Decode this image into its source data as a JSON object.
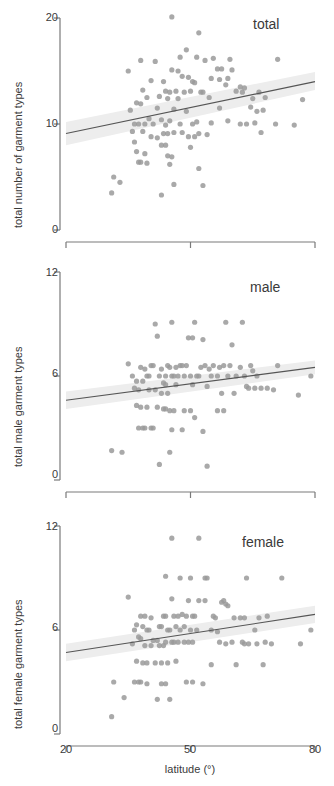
{
  "figure": {
    "type": "scatter-multi-panel",
    "panel_count": 3,
    "point_color": "#9a9a9a",
    "line_color": "#555555",
    "band_color": "#ededed",
    "axis_color": "#7a7a7a",
    "background": "#ffffff"
  },
  "xaxis": {
    "label": "latitude (°)",
    "ticks": [
      "20",
      "50",
      "80"
    ],
    "tick_values": [
      20,
      50,
      80
    ],
    "range": [
      20,
      80
    ]
  },
  "panels": [
    {
      "tag": "total",
      "ylabel": "total number of garment types",
      "yticks": [
        "0",
        "10",
        "20"
      ],
      "ytick_values": [
        0,
        10,
        20
      ],
      "yrange": [
        0,
        20
      ]
    },
    {
      "tag": "male",
      "ylabel": "total male garment types",
      "yticks": [
        "0",
        "6",
        "12"
      ],
      "ytick_values": [
        0,
        6,
        12
      ],
      "yrange": [
        0,
        12
      ]
    },
    {
      "tag": "female",
      "ylabel": "total female garment types",
      "yticks": [
        "0",
        "6",
        "12"
      ],
      "ytick_values": [
        0,
        6,
        12
      ],
      "yrange": [
        0,
        12
      ]
    }
  ],
  "chart_data": [
    {
      "type": "scatter",
      "title": "total",
      "xlabel": "latitude (°)",
      "ylabel": "total number of garment types",
      "xlim": [
        20,
        80
      ],
      "ylim": [
        0,
        20
      ],
      "xticks": [
        20,
        50,
        80
      ],
      "yticks": [
        0,
        10,
        20
      ],
      "grid": false,
      "legend": "none",
      "annotations": [
        "total"
      ],
      "regression": {
        "x": [
          20,
          80
        ],
        "y": [
          9.1,
          14.0
        ],
        "ci_lower": [
          8.0,
          13.2
        ],
        "ci_upper": [
          10.2,
          14.9
        ]
      },
      "points": [
        [
          45.5,
          20.1
        ],
        [
          52.0,
          18.6
        ],
        [
          49.0,
          17.0
        ],
        [
          47.5,
          16.3
        ],
        [
          51.5,
          16.3
        ],
        [
          55.5,
          16.2
        ],
        [
          53.5,
          16.0
        ],
        [
          59.5,
          16.1
        ],
        [
          71.0,
          16.1
        ],
        [
          38.0,
          16.0
        ],
        [
          41.5,
          15.9
        ],
        [
          35.0,
          15.0
        ],
        [
          45.5,
          15.1
        ],
        [
          47.0,
          15.0
        ],
        [
          56.5,
          15.2
        ],
        [
          57.5,
          15.2
        ],
        [
          60.0,
          15.1
        ],
        [
          48.0,
          14.5
        ],
        [
          49.5,
          14.4
        ],
        [
          55.0,
          14.3
        ],
        [
          59.0,
          14.3
        ],
        [
          57.0,
          14.2
        ],
        [
          40.5,
          14.1
        ],
        [
          43.5,
          14.0
        ],
        [
          50.5,
          14.0
        ],
        [
          51.0,
          13.9
        ],
        [
          58.5,
          13.7
        ],
        [
          62.0,
          13.5
        ],
        [
          63.0,
          13.4
        ],
        [
          38.5,
          13.2
        ],
        [
          44.0,
          13.1
        ],
        [
          45.0,
          13.0
        ],
        [
          46.5,
          13.1
        ],
        [
          48.5,
          13.0
        ],
        [
          50.0,
          13.1
        ],
        [
          52.5,
          13.0
        ],
        [
          53.0,
          13.0
        ],
        [
          61.0,
          13.1
        ],
        [
          62.5,
          13.0
        ],
        [
          66.5,
          13.0
        ],
        [
          39.5,
          12.5
        ],
        [
          42.5,
          12.6
        ],
        [
          44.5,
          12.4
        ],
        [
          47.0,
          12.4
        ],
        [
          54.5,
          12.5
        ],
        [
          65.0,
          12.4
        ],
        [
          68.0,
          12.5
        ],
        [
          77.0,
          12.3
        ],
        [
          37.0,
          12.0
        ],
        [
          38.0,
          11.9
        ],
        [
          42.0,
          11.5
        ],
        [
          46.0,
          11.4
        ],
        [
          49.0,
          11.2
        ],
        [
          57.0,
          11.5
        ],
        [
          64.5,
          11.6
        ],
        [
          66.0,
          11.2
        ],
        [
          67.5,
          11.3
        ],
        [
          35.5,
          11.3
        ],
        [
          40.0,
          10.5
        ],
        [
          43.0,
          10.4
        ],
        [
          45.0,
          10.3
        ],
        [
          51.5,
          10.2
        ],
        [
          55.0,
          10.1
        ],
        [
          59.0,
          10.3
        ],
        [
          36.5,
          10.0
        ],
        [
          37.5,
          10.0
        ],
        [
          39.0,
          10.0
        ],
        [
          41.0,
          10.0
        ],
        [
          44.0,
          9.9
        ],
        [
          47.5,
          10.0
        ],
        [
          50.5,
          10.0
        ],
        [
          62.0,
          10.0
        ],
        [
          63.5,
          10.0
        ],
        [
          65.5,
          10.1
        ],
        [
          70.5,
          10.0
        ],
        [
          75.0,
          9.9
        ],
        [
          36.0,
          9.3
        ],
        [
          38.5,
          9.3
        ],
        [
          43.5,
          9.1
        ],
        [
          44.5,
          9.1
        ],
        [
          46.0,
          9.2
        ],
        [
          48.0,
          9.2
        ],
        [
          52.0,
          9.1
        ],
        [
          54.0,
          9.0
        ],
        [
          67.0,
          9.2
        ],
        [
          40.5,
          8.8
        ],
        [
          42.0,
          8.7
        ],
        [
          49.5,
          8.8
        ],
        [
          51.0,
          8.8
        ],
        [
          36.5,
          8.3
        ],
        [
          43.0,
          8.0
        ],
        [
          44.0,
          8.0
        ],
        [
          50.0,
          7.8
        ],
        [
          37.0,
          7.4
        ],
        [
          39.0,
          7.2
        ],
        [
          44.5,
          7.0
        ],
        [
          45.5,
          6.9
        ],
        [
          37.5,
          6.4
        ],
        [
          38.0,
          6.4
        ],
        [
          39.5,
          6.3
        ],
        [
          45.0,
          6.2
        ],
        [
          52.0,
          5.8
        ],
        [
          31.5,
          5.0
        ],
        [
          33.0,
          4.5
        ],
        [
          46.0,
          4.3
        ],
        [
          53.0,
          4.2
        ],
        [
          31.0,
          3.5
        ],
        [
          43.0,
          3.3
        ]
      ]
    },
    {
      "type": "scatter",
      "title": "male",
      "xlabel": "latitude (°)",
      "ylabel": "total male garment types",
      "xlim": [
        20,
        80
      ],
      "ylim": [
        0,
        12
      ],
      "xticks": [
        20,
        50,
        80
      ],
      "yticks": [
        0,
        6,
        12
      ],
      "grid": false,
      "legend": "none",
      "annotations": [
        "male"
      ],
      "regression": {
        "x": [
          20,
          80
        ],
        "y": [
          4.6,
          6.5
        ],
        "ci_lower": [
          4.1,
          6.1
        ],
        "ci_upper": [
          5.1,
          6.9
        ]
      },
      "points": [
        [
          45.5,
          9.1
        ],
        [
          51.0,
          9.1
        ],
        [
          58.5,
          9.1
        ],
        [
          62.5,
          9.1
        ],
        [
          41.5,
          9.0
        ],
        [
          42.0,
          8.3
        ],
        [
          49.5,
          8.2
        ],
        [
          50.5,
          8.2
        ],
        [
          53.0,
          8.1
        ],
        [
          60.0,
          7.8
        ],
        [
          35.0,
          6.7
        ],
        [
          40.5,
          6.6
        ],
        [
          41.0,
          6.6
        ],
        [
          44.5,
          6.6
        ],
        [
          45.0,
          6.5
        ],
        [
          47.5,
          6.6
        ],
        [
          48.0,
          6.6
        ],
        [
          49.0,
          6.6
        ],
        [
          52.5,
          6.5
        ],
        [
          53.5,
          6.6
        ],
        [
          55.5,
          6.6
        ],
        [
          57.0,
          6.5
        ],
        [
          58.0,
          6.6
        ],
        [
          59.5,
          6.6
        ],
        [
          62.0,
          6.5
        ],
        [
          64.5,
          6.6
        ],
        [
          71.0,
          6.6
        ],
        [
          38.0,
          6.5
        ],
        [
          39.0,
          6.4
        ],
        [
          43.0,
          6.4
        ],
        [
          46.5,
          6.5
        ],
        [
          54.5,
          6.4
        ],
        [
          65.0,
          6.3
        ],
        [
          36.0,
          6.0
        ],
        [
          39.5,
          6.0
        ],
        [
          40.0,
          6.0
        ],
        [
          42.5,
          6.0
        ],
        [
          44.0,
          6.0
        ],
        [
          45.5,
          6.0
        ],
        [
          46.0,
          6.0
        ],
        [
          47.0,
          6.0
        ],
        [
          48.5,
          6.0
        ],
        [
          50.0,
          6.0
        ],
        [
          51.5,
          6.0
        ],
        [
          52.0,
          6.0
        ],
        [
          55.0,
          6.0
        ],
        [
          56.5,
          6.0
        ],
        [
          59.0,
          6.0
        ],
        [
          61.0,
          6.0
        ],
        [
          63.0,
          6.0
        ],
        [
          66.0,
          6.0
        ],
        [
          79.0,
          6.0
        ],
        [
          37.0,
          5.7
        ],
        [
          38.5,
          5.7
        ],
        [
          43.5,
          5.6
        ],
        [
          44.0,
          5.5
        ],
        [
          46.5,
          5.5
        ],
        [
          50.5,
          5.5
        ],
        [
          54.0,
          5.4
        ],
        [
          63.5,
          5.4
        ],
        [
          64.0,
          5.3
        ],
        [
          65.5,
          5.3
        ],
        [
          67.0,
          5.3
        ],
        [
          68.5,
          5.3
        ],
        [
          70.0,
          5.2
        ],
        [
          36.5,
          5.3
        ],
        [
          37.5,
          5.2
        ],
        [
          40.0,
          5.2
        ],
        [
          41.5,
          5.2
        ],
        [
          43.0,
          5.0
        ],
        [
          44.5,
          5.0
        ],
        [
          57.5,
          5.0
        ],
        [
          60.5,
          5.0
        ],
        [
          76.0,
          4.9
        ],
        [
          37.0,
          4.3
        ],
        [
          38.0,
          4.2
        ],
        [
          39.5,
          4.2
        ],
        [
          42.0,
          4.2
        ],
        [
          43.5,
          4.1
        ],
        [
          44.0,
          4.1
        ],
        [
          45.0,
          4.0
        ],
        [
          46.0,
          4.0
        ],
        [
          48.5,
          4.0
        ],
        [
          50.0,
          4.0
        ],
        [
          56.5,
          4.0
        ],
        [
          58.0,
          4.0
        ],
        [
          51.0,
          3.6
        ],
        [
          37.5,
          3.0
        ],
        [
          38.5,
          3.0
        ],
        [
          39.0,
          3.0
        ],
        [
          40.5,
          3.0
        ],
        [
          41.0,
          3.0
        ],
        [
          45.5,
          2.9
        ],
        [
          48.0,
          2.9
        ],
        [
          53.0,
          2.8
        ],
        [
          31.0,
          1.7
        ],
        [
          33.5,
          1.6
        ],
        [
          45.0,
          1.6
        ],
        [
          42.5,
          0.9
        ],
        [
          54.0,
          0.8
        ]
      ]
    },
    {
      "type": "scatter",
      "title": "female",
      "xlabel": "latitude (°)",
      "ylabel": "total female garment types",
      "xlim": [
        20,
        80
      ],
      "ylim": [
        0,
        12
      ],
      "xticks": [
        20,
        50,
        80
      ],
      "yticks": [
        0,
        6,
        12
      ],
      "grid": false,
      "legend": "none",
      "annotations": [
        "female"
      ],
      "regression": {
        "x": [
          20,
          80
        ],
        "y": [
          4.7,
          6.9
        ],
        "ci_lower": [
          4.2,
          6.4
        ],
        "ci_upper": [
          5.2,
          7.4
        ]
      },
      "points": [
        [
          45.5,
          11.3
        ],
        [
          52.0,
          11.3
        ],
        [
          44.0,
          9.1
        ],
        [
          47.5,
          9.0
        ],
        [
          50.0,
          9.0
        ],
        [
          53.5,
          9.0
        ],
        [
          54.0,
          9.0
        ],
        [
          63.5,
          9.0
        ],
        [
          72.0,
          9.0
        ],
        [
          35.0,
          7.9
        ],
        [
          45.5,
          7.8
        ],
        [
          49.5,
          7.7
        ],
        [
          52.0,
          7.7
        ],
        [
          53.5,
          7.7
        ],
        [
          57.5,
          7.6
        ],
        [
          58.0,
          7.7
        ],
        [
          58.5,
          7.5
        ],
        [
          59.0,
          7.4
        ],
        [
          38.0,
          6.8
        ],
        [
          39.0,
          6.8
        ],
        [
          40.5,
          6.7
        ],
        [
          43.5,
          6.8
        ],
        [
          44.0,
          6.8
        ],
        [
          46.0,
          6.8
        ],
        [
          47.0,
          6.8
        ],
        [
          48.0,
          6.9
        ],
        [
          49.0,
          6.8
        ],
        [
          50.5,
          6.8
        ],
        [
          51.0,
          6.8
        ],
        [
          55.5,
          6.8
        ],
        [
          56.0,
          6.7
        ],
        [
          60.5,
          6.7
        ],
        [
          62.0,
          6.7
        ],
        [
          63.0,
          6.7
        ],
        [
          66.5,
          6.7
        ],
        [
          68.5,
          6.8
        ],
        [
          37.0,
          6.3
        ],
        [
          38.5,
          6.2
        ],
        [
          42.5,
          6.2
        ],
        [
          43.0,
          6.2
        ],
        [
          46.5,
          6.2
        ],
        [
          48.5,
          6.2
        ],
        [
          36.5,
          6.0
        ],
        [
          39.5,
          6.0
        ],
        [
          40.0,
          6.0
        ],
        [
          44.5,
          6.0
        ],
        [
          45.0,
          6.0
        ],
        [
          47.5,
          6.0
        ],
        [
          50.0,
          6.0
        ],
        [
          51.5,
          6.0
        ],
        [
          55.0,
          6.0
        ],
        [
          56.5,
          5.9
        ],
        [
          65.5,
          6.0
        ],
        [
          79.0,
          6.0
        ],
        [
          37.5,
          5.6
        ],
        [
          38.0,
          5.5
        ],
        [
          41.0,
          5.4
        ],
        [
          42.0,
          5.4
        ],
        [
          44.0,
          5.3
        ],
        [
          45.5,
          5.3
        ],
        [
          46.0,
          5.3
        ],
        [
          47.0,
          5.3
        ],
        [
          48.5,
          5.3
        ],
        [
          49.5,
          5.3
        ],
        [
          50.5,
          5.3
        ],
        [
          57.0,
          5.3
        ],
        [
          58.5,
          5.2
        ],
        [
          60.0,
          5.3
        ],
        [
          62.5,
          5.3
        ],
        [
          63.0,
          5.2
        ],
        [
          64.0,
          5.2
        ],
        [
          66.0,
          5.2
        ],
        [
          68.0,
          5.3
        ],
        [
          69.5,
          5.2
        ],
        [
          76.5,
          5.2
        ],
        [
          36.0,
          5.2
        ],
        [
          39.0,
          5.1
        ],
        [
          40.5,
          5.1
        ],
        [
          42.5,
          5.1
        ],
        [
          43.5,
          5.1
        ],
        [
          37.0,
          4.2
        ],
        [
          38.5,
          4.1
        ],
        [
          39.5,
          4.1
        ],
        [
          41.5,
          4.1
        ],
        [
          43.0,
          4.1
        ],
        [
          44.5,
          4.1
        ],
        [
          46.5,
          4.2
        ],
        [
          55.0,
          4.0
        ],
        [
          61.0,
          4.0
        ],
        [
          67.5,
          4.0
        ],
        [
          31.5,
          3.0
        ],
        [
          36.5,
          3.0
        ],
        [
          37.5,
          3.0
        ],
        [
          38.0,
          3.0
        ],
        [
          39.5,
          2.9
        ],
        [
          43.0,
          2.9
        ],
        [
          44.0,
          2.9
        ],
        [
          49.0,
          3.0
        ],
        [
          50.5,
          3.0
        ],
        [
          53.0,
          2.9
        ],
        [
          34.0,
          2.1
        ],
        [
          42.0,
          2.0
        ],
        [
          45.0,
          2.0
        ],
        [
          31.0,
          1.0
        ]
      ]
    }
  ]
}
